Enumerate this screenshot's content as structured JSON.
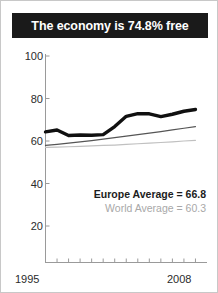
{
  "title": {
    "text": "The economy is 74.8% free"
  },
  "legend": {
    "europe": "Europe Average = 66.8",
    "world": "World Average = 60.3"
  },
  "colors": {
    "banner_background": "#1a1a1a",
    "banner_text": "#ffffff",
    "country_line": "#101010",
    "europe_line": "#555555",
    "world_line": "#c0c0c0",
    "axis": "#9a9a9a",
    "tick_text": "#2b2b2b"
  },
  "chart_data": {
    "type": "line",
    "title": "The economy is 74.8% free",
    "xlabel": "",
    "ylabel": "",
    "xlim": [
      1995,
      2009
    ],
    "ylim": [
      0,
      100
    ],
    "grid": false,
    "legend_position": "inside-bottom-right",
    "xticks": [
      1995,
      1996,
      1997,
      1998,
      1999,
      2000,
      2001,
      2002,
      2003,
      2004,
      2005,
      2006,
      2007,
      2008
    ],
    "xtick_labels_shown": [
      "1995",
      "2008"
    ],
    "yticks": [
      20,
      40,
      60,
      80,
      100
    ],
    "ytick_labels": [
      "20",
      "40",
      "60",
      "80",
      "100"
    ],
    "x": [
      1995,
      1996,
      1997,
      1998,
      1999,
      2000,
      2001,
      2002,
      2003,
      2004,
      2005,
      2006,
      2007,
      2008
    ],
    "series": [
      {
        "name": "Country",
        "style": "thick-black",
        "color": "#101010",
        "values": [
          64.3,
          65.2,
          62.6,
          62.8,
          62.7,
          63.0,
          66.8,
          71.6,
          72.9,
          72.8,
          71.5,
          72.6,
          74.0,
          74.8
        ]
      },
      {
        "name": "Europe Average",
        "style": "thin-dark-gray",
        "color": "#555555",
        "final_value": 66.8,
        "values": [
          57.9,
          58.4,
          59.0,
          59.6,
          60.2,
          60.9,
          61.6,
          62.3,
          63.0,
          63.7,
          64.4,
          65.2,
          66.0,
          66.8
        ]
      },
      {
        "name": "World Average",
        "style": "thin-light-gray",
        "color": "#c0c0c0",
        "final_value": 60.3,
        "values": [
          57.0,
          57.1,
          57.3,
          57.5,
          57.7,
          57.9,
          58.1,
          58.4,
          58.7,
          59.0,
          59.3,
          59.6,
          60.0,
          60.3
        ]
      }
    ]
  }
}
